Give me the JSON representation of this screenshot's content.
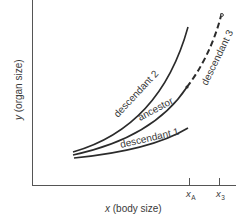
{
  "diagram": {
    "type": "allometric growth curves",
    "axes": {
      "x_label_var": "x",
      "x_label_rest": " (body size)",
      "y_label_var": "y",
      "y_label_rest": " (organ size)"
    },
    "ticks": [
      {
        "id": "xA",
        "base": "x",
        "sub": "A"
      },
      {
        "id": "x3",
        "base": "x",
        "sub": "3"
      }
    ],
    "curves": [
      {
        "id": "descendant-2",
        "label": "descendant 2",
        "style": "solid"
      },
      {
        "id": "ancestor",
        "label": "ancestor",
        "style": "solid"
      },
      {
        "id": "descendant-1",
        "label": "descendant 1",
        "style": "solid"
      },
      {
        "id": "descendant-3",
        "label": "descendant 3",
        "style": "dashed"
      }
    ],
    "colors": {
      "line": "#2b2b2b",
      "axis": "#555555",
      "text": "#3a3a3a",
      "background": "#ffffff"
    }
  }
}
